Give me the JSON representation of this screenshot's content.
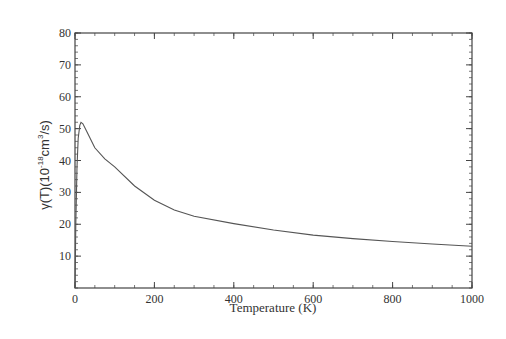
{
  "chart_data": {
    "type": "line",
    "title": "",
    "xlabel": "Temperature (K)",
    "ylabel": {
      "prefix": "γ(T)(10",
      "exp1": "-18",
      "mid": "cm",
      "exp2": "3",
      "suffix": "/s)"
    },
    "xlim": [
      0,
      1000
    ],
    "ylim": [
      0,
      80
    ],
    "xticks": [
      0,
      200,
      400,
      600,
      800,
      1000
    ],
    "yticks": [
      10,
      20,
      30,
      40,
      50,
      60,
      70,
      80
    ],
    "x_minor_step": 50,
    "y_minor_step": 2,
    "grid": false,
    "legend": null,
    "series": [
      {
        "name": "γ(T)",
        "color": "#555555",
        "x": [
          0,
          2,
          5,
          8,
          12,
          15,
          20,
          30,
          50,
          75,
          100,
          150,
          200,
          250,
          300,
          400,
          500,
          600,
          700,
          800,
          900,
          1000
        ],
        "y": [
          0,
          20,
          38,
          47,
          51,
          52,
          51.5,
          49,
          44,
          40.5,
          38,
          32,
          27.5,
          24.5,
          22.5,
          20.2,
          18.2,
          16.6,
          15.5,
          14.6,
          13.8,
          13.1
        ]
      }
    ]
  }
}
